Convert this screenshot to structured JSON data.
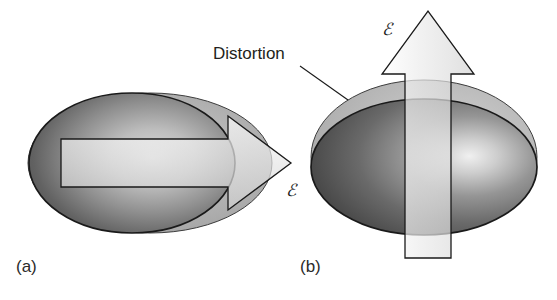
{
  "figure": {
    "background_color": "#ffffff",
    "width": 557,
    "height": 300
  },
  "annotations": {
    "distortion_label": "Distortion",
    "field_label_horizontal": "ℰ",
    "field_label_vertical": "ℰ"
  },
  "panels": [
    {
      "id": "a",
      "label": "(a)",
      "description": "Undistorted spherical electron cloud with horizontal field arrow",
      "arrow_direction": "right",
      "field_label": "ℰ"
    },
    {
      "id": "b",
      "label": "(b)",
      "description": "Distorted oblate electron cloud with vertical field arrow",
      "arrow_direction": "up",
      "field_label": "ℰ"
    }
  ],
  "colors": {
    "outline": "#1a1a1a",
    "cloud_dark": "#4a4a4a",
    "cloud_mid": "#8c8c8c",
    "cloud_highlight": "#e8e8e8",
    "cloud_shadow": "#595959",
    "ghost_ellipse": "#b5b5b5",
    "arrow_fill_light": "#f2f2f2",
    "arrow_fill_mid": "#d8d8d8",
    "text": "#231f20"
  }
}
